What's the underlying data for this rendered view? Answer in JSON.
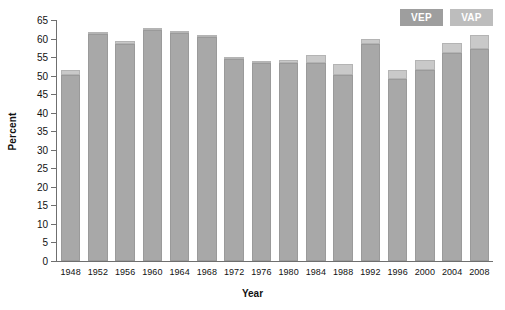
{
  "chart_data": {
    "type": "bar",
    "title": "",
    "subtitle": "",
    "xlabel": "Year",
    "ylabel": "Percent",
    "ylim": [
      0,
      65
    ],
    "ytick_step": 5,
    "yticks": [
      0,
      5,
      10,
      15,
      20,
      25,
      30,
      35,
      40,
      45,
      50,
      55,
      60,
      65
    ],
    "grid": false,
    "legend_position": "top-right",
    "stacked": true,
    "categories": [
      "1948",
      "1952",
      "1956",
      "1960",
      "1964",
      "1968",
      "1972",
      "1976",
      "1980",
      "1984",
      "1988",
      "1992",
      "1996",
      "2000",
      "2004",
      "2008"
    ],
    "series": [
      {
        "name": "VAP",
        "color": "#a8a8a8",
        "values": [
          50.3,
          61.2,
          58.5,
          62.3,
          61.4,
          60.4,
          54.6,
          53.3,
          53.3,
          53.3,
          50.3,
          58.4,
          49.2,
          51.6,
          56.2,
          57.1
        ]
      },
      {
        "name": "VEP",
        "color": "#c9c9c9",
        "values": [
          51.5,
          61.6,
          59.3,
          62.8,
          61.9,
          60.8,
          55.1,
          54.0,
          54.2,
          55.5,
          53.2,
          59.9,
          51.4,
          54.3,
          58.7,
          60.9
        ]
      }
    ],
    "legend": [
      {
        "label": "VEP",
        "color": "#9e9e9e"
      },
      {
        "label": "VAP",
        "color": "#bdbdbd"
      }
    ]
  }
}
